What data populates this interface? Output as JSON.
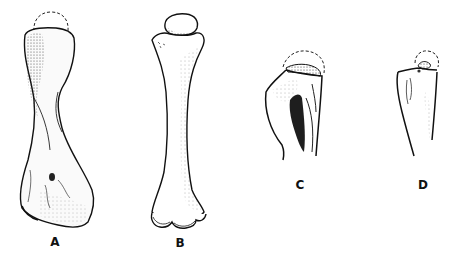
{
  "figure": {
    "panels": [
      {
        "id": "A",
        "label": "A",
        "label_x": 55,
        "label_y": 236
      },
      {
        "id": "B",
        "label": "B",
        "label_x": 180,
        "label_y": 237
      },
      {
        "id": "C",
        "label": "C",
        "label_x": 300,
        "label_y": 179
      },
      {
        "id": "D",
        "label": "D",
        "label_x": 423,
        "label_y": 179
      }
    ],
    "caption": ""
  },
  "colors": {
    "ink": "#111111",
    "shade": "#555555",
    "background": "#ffffff"
  }
}
